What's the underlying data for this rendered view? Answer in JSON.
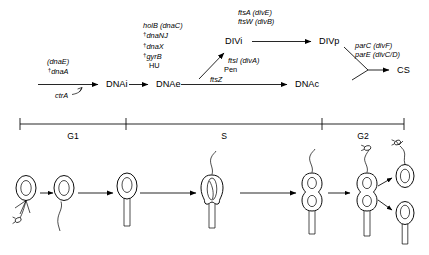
{
  "figure": {
    "type": "diagram"
  },
  "pathway": {
    "nodes": [
      {
        "id": "dnai",
        "label": "DNAi"
      },
      {
        "id": "dnae",
        "label": "DNAe"
      },
      {
        "id": "dnac",
        "label": "DNAc"
      },
      {
        "id": "divi",
        "label": "DIVi"
      },
      {
        "id": "divp",
        "label": "DIVp"
      },
      {
        "id": "cs",
        "label": "CS"
      }
    ],
    "gene_groups": [
      {
        "id": "initiation-genes",
        "lines": [
          {
            "dagger": false,
            "text": "(dnaE)"
          },
          {
            "dagger": true,
            "text": "dnaA"
          }
        ]
      },
      {
        "id": "elongation-genes",
        "lines": [
          {
            "dagger": false,
            "text": "holB (dnaC)"
          },
          {
            "dagger": true,
            "text": "dnaNJ"
          },
          {
            "dagger": true,
            "text": "dnaX"
          },
          {
            "dagger": true,
            "text": "gyrB"
          },
          {
            "dagger": false,
            "text": "HU",
            "italic": false
          }
        ]
      },
      {
        "id": "division-initiation-genes",
        "lines": [
          {
            "dagger": false,
            "text": "ftsI (divA)"
          },
          {
            "dagger": false,
            "text": "Pen",
            "italic": false
          },
          {
            "dagger": false,
            "text": "ftsZ"
          }
        ]
      },
      {
        "id": "division-progression-genes",
        "lines": [
          {
            "dagger": false,
            "text": "ftsA (divE)"
          },
          {
            "dagger": false,
            "text": "ftsW (divB)"
          }
        ]
      },
      {
        "id": "separation-genes",
        "lines": [
          {
            "dagger": false,
            "text": "parC (divF)"
          },
          {
            "dagger": false,
            "text": "parE (divC/D)"
          }
        ]
      }
    ],
    "regulator": {
      "id": "ctrA",
      "label": "ctrA"
    }
  },
  "timeline": {
    "phases": [
      {
        "id": "g1",
        "label": "G1"
      },
      {
        "id": "s",
        "label": "S"
      },
      {
        "id": "g2",
        "label": "G2"
      }
    ]
  },
  "cell_stages": [
    {
      "id": "swarmer-cell",
      "description": "swarmer cell with flagellum and pili"
    },
    {
      "id": "shedding-flagellum-cell",
      "description": "cell shedding flagellum"
    },
    {
      "id": "stalked-cell",
      "description": "stalked cell"
    },
    {
      "id": "replicating-cell",
      "description": "stalked cell replicating chromosome"
    },
    {
      "id": "predivisional-cell",
      "description": "predivisional cell with flagellum"
    },
    {
      "id": "dividing-cell",
      "description": "dividing cell releasing progeny"
    },
    {
      "id": "daughter-swarmer-cell",
      "description": "daughter swarmer cell"
    },
    {
      "id": "daughter-stalked-cell",
      "description": "daughter stalked cell"
    }
  ],
  "colors": {
    "stroke": "#000000",
    "background": "#ffffff"
  }
}
